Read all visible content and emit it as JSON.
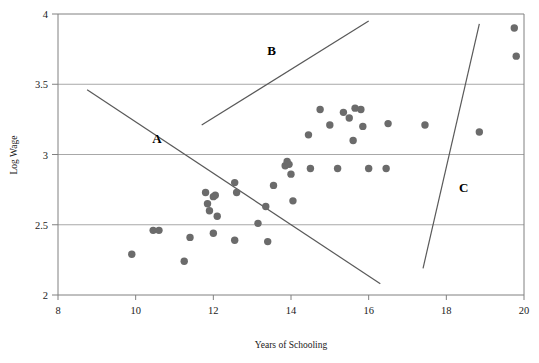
{
  "chart_data": {
    "type": "scatter",
    "title": "",
    "xlabel": "Years of Schooling",
    "ylabel": "Log Wage",
    "xlim": [
      8,
      20
    ],
    "ylim": [
      2,
      4
    ],
    "xticks": [
      8,
      10,
      12,
      14,
      16,
      18,
      20
    ],
    "yticks": [
      2,
      2.5,
      3,
      3.5,
      4
    ],
    "xtick_labels": [
      "8",
      "10",
      "12",
      "14",
      "16",
      "18",
      "20"
    ],
    "ytick_labels": [
      "2",
      "2.5",
      "3",
      "3.5",
      "4"
    ],
    "grid": "horizontal",
    "legend": "none",
    "point_color": "#6b6b6b",
    "line_color": "#595959",
    "axis_color": "#808080",
    "grid_color": "#a8a8a8",
    "points": [
      {
        "x": 9.9,
        "y": 2.29
      },
      {
        "x": 10.45,
        "y": 2.46
      },
      {
        "x": 10.6,
        "y": 2.46
      },
      {
        "x": 11.25,
        "y": 2.24
      },
      {
        "x": 11.4,
        "y": 2.41
      },
      {
        "x": 11.8,
        "y": 2.73
      },
      {
        "x": 11.85,
        "y": 2.65
      },
      {
        "x": 11.9,
        "y": 2.6
      },
      {
        "x": 12.0,
        "y": 2.7
      },
      {
        "x": 12.05,
        "y": 2.71
      },
      {
        "x": 12.0,
        "y": 2.44
      },
      {
        "x": 12.1,
        "y": 2.56
      },
      {
        "x": 12.55,
        "y": 2.8
      },
      {
        "x": 12.6,
        "y": 2.73
      },
      {
        "x": 12.55,
        "y": 2.39
      },
      {
        "x": 13.15,
        "y": 2.51
      },
      {
        "x": 13.35,
        "y": 2.63
      },
      {
        "x": 13.4,
        "y": 2.38
      },
      {
        "x": 13.55,
        "y": 2.78
      },
      {
        "x": 13.85,
        "y": 2.92
      },
      {
        "x": 13.9,
        "y": 2.95
      },
      {
        "x": 13.95,
        "y": 2.93
      },
      {
        "x": 14.0,
        "y": 2.86
      },
      {
        "x": 14.05,
        "y": 2.67
      },
      {
        "x": 14.45,
        "y": 3.14
      },
      {
        "x": 14.5,
        "y": 2.9
      },
      {
        "x": 14.75,
        "y": 3.32
      },
      {
        "x": 15.0,
        "y": 3.21
      },
      {
        "x": 15.2,
        "y": 2.9
      },
      {
        "x": 15.35,
        "y": 3.3
      },
      {
        "x": 15.5,
        "y": 3.26
      },
      {
        "x": 15.6,
        "y": 3.1
      },
      {
        "x": 15.65,
        "y": 3.33
      },
      {
        "x": 15.8,
        "y": 3.32
      },
      {
        "x": 15.85,
        "y": 3.2
      },
      {
        "x": 16.0,
        "y": 2.9
      },
      {
        "x": 16.45,
        "y": 2.9
      },
      {
        "x": 16.5,
        "y": 3.22
      },
      {
        "x": 17.45,
        "y": 3.21
      },
      {
        "x": 18.85,
        "y": 3.16
      },
      {
        "x": 19.75,
        "y": 3.9
      },
      {
        "x": 19.8,
        "y": 3.7
      }
    ],
    "lines": [
      {
        "label": "A",
        "x1": 8.75,
        "y1": 3.46,
        "x2": 16.3,
        "y2": 2.08
      },
      {
        "label": "B",
        "x1": 11.7,
        "y1": 3.21,
        "x2": 16.0,
        "y2": 3.95
      },
      {
        "label": "C",
        "x1": 17.4,
        "y1": 2.19,
        "x2": 18.85,
        "y2": 3.93
      }
    ],
    "annotations": [
      {
        "text": "A",
        "x": 10.55,
        "y": 3.08
      },
      {
        "text": "B",
        "x": 13.5,
        "y": 3.71
      },
      {
        "text": "C",
        "x": 18.45,
        "y": 2.73
      }
    ]
  }
}
